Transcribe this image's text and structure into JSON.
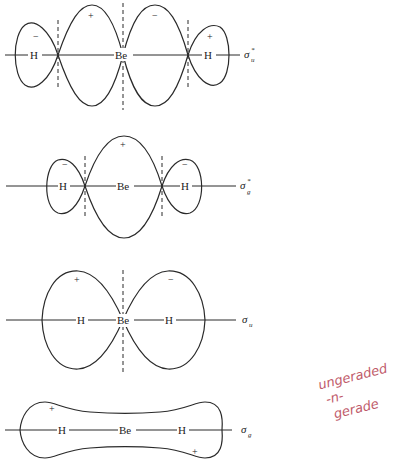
{
  "diagram": {
    "orbitals": [
      {
        "id": "sigma_u_star",
        "label": "σ",
        "subscript": "u",
        "superscript": "*",
        "atoms": [
          "H",
          "Be",
          "H"
        ],
        "lobe_signs": [
          "−",
          "+",
          "−",
          "+"
        ]
      },
      {
        "id": "sigma_g_star",
        "label": "σ",
        "subscript": "g",
        "superscript": "*",
        "atoms": [
          "H",
          "Be",
          "H"
        ],
        "lobe_signs": [
          "−",
          "+",
          "−"
        ]
      },
      {
        "id": "sigma_u",
        "label": "σ",
        "subscript": "u",
        "superscript": "",
        "atoms": [
          "H",
          "Be",
          "H"
        ],
        "lobe_signs": [
          "+",
          "−"
        ]
      },
      {
        "id": "sigma_g",
        "label": "σ",
        "subscript": "g",
        "superscript": "",
        "atoms": [
          "H",
          "Be",
          "H"
        ],
        "lobe_signs": [
          "+",
          "+"
        ]
      }
    ],
    "annotation": {
      "lines": [
        "ungeraded",
        "-n-",
        "gerade"
      ],
      "color": "#c05a6a"
    }
  }
}
